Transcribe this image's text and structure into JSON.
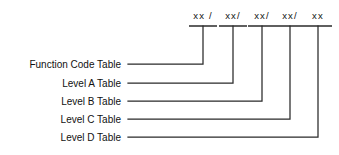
{
  "diagram": {
    "code_segments": [
      {
        "text": "xx /",
        "value": "xx",
        "separator": "/"
      },
      {
        "text": "xx/",
        "value": "xx",
        "separator": "/"
      },
      {
        "text": "xx/",
        "value": "xx",
        "separator": "/"
      },
      {
        "text": "xx/",
        "value": "xx",
        "separator": "/"
      },
      {
        "text": "xx",
        "value": "xx",
        "separator": ""
      }
    ],
    "rows": [
      {
        "label": "Function Code Table"
      },
      {
        "label": "Level A Table"
      },
      {
        "label": "Level B Table"
      },
      {
        "label": "Level C Table"
      },
      {
        "label": "Level D Table"
      }
    ],
    "colors": {
      "background": "#ffffff",
      "line": "#2a2a2a",
      "text": "#111111"
    }
  },
  "geometry": {
    "segment_x": [
      203,
      233,
      262,
      290,
      318
    ],
    "segment_text_y": 19,
    "bar_y": 26,
    "bar_half_width": 14,
    "row_y": [
      64,
      83,
      101,
      119,
      137
    ],
    "label_right_x": 121,
    "line_start_x": 128
  }
}
